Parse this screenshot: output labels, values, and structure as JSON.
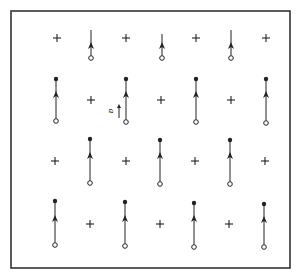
{
  "diagram": {
    "type": "lattice-vector-field",
    "frame": {
      "x": 11,
      "y": 11,
      "width": 279,
      "height": 257,
      "stroke": "#333333"
    },
    "colors": {
      "ink": "#222222",
      "background": "#ffffff"
    },
    "legend_label": {
      "text": "a",
      "x": 113,
      "y": 112
    },
    "legend_arrow": {
      "x": 119,
      "y1": 118,
      "y2": 104
    },
    "rows": [
      {
        "y_plus": 38,
        "items": [
          {
            "kind": "plus",
            "x": 57
          },
          {
            "kind": "arrow",
            "x": 91,
            "y_top": 30,
            "y_head": 47,
            "y_bottom": 58,
            "top_dot": false
          },
          {
            "kind": "plus",
            "x": 126
          },
          {
            "kind": "arrow",
            "x": 162,
            "y_top": 34,
            "y_head": 47,
            "y_bottom": 58,
            "top_dot": false
          },
          {
            "kind": "plus",
            "x": 196
          },
          {
            "kind": "arrow",
            "x": 231,
            "y_top": 30,
            "y_head": 47,
            "y_bottom": 58,
            "top_dot": false
          },
          {
            "kind": "plus",
            "x": 266
          }
        ]
      },
      {
        "y_plus": 100,
        "items": [
          {
            "kind": "arrow",
            "x": 56,
            "y_top": 79,
            "y_head": 96,
            "y_bottom": 121,
            "top_dot": true
          },
          {
            "kind": "plus",
            "x": 91
          },
          {
            "kind": "arrow",
            "x": 126,
            "y_top": 79,
            "y_head": 96,
            "y_bottom": 122,
            "top_dot": true
          },
          {
            "kind": "plus",
            "x": 161
          },
          {
            "kind": "arrow",
            "x": 196,
            "y_top": 79,
            "y_head": 96,
            "y_bottom": 122,
            "top_dot": true
          },
          {
            "kind": "plus",
            "x": 231
          },
          {
            "kind": "arrow",
            "x": 266,
            "y_top": 79,
            "y_head": 96,
            "y_bottom": 123,
            "top_dot": true
          }
        ]
      },
      {
        "y_plus": 161,
        "items": [
          {
            "kind": "plus",
            "x": 55
          },
          {
            "kind": "arrow",
            "x": 90,
            "y_top": 139,
            "y_head": 157,
            "y_bottom": 183,
            "top_dot": true
          },
          {
            "kind": "plus",
            "x": 126
          },
          {
            "kind": "arrow",
            "x": 160,
            "y_top": 140,
            "y_head": 157,
            "y_bottom": 184,
            "top_dot": true
          },
          {
            "kind": "plus",
            "x": 195
          },
          {
            "kind": "arrow",
            "x": 230,
            "y_top": 140,
            "y_head": 157,
            "y_bottom": 184,
            "top_dot": true
          },
          {
            "kind": "plus",
            "x": 265
          }
        ]
      },
      {
        "y_plus": 224,
        "items": [
          {
            "kind": "arrow",
            "x": 55,
            "y_top": 201,
            "y_head": 220,
            "y_bottom": 245,
            "top_dot": true
          },
          {
            "kind": "plus",
            "x": 90
          },
          {
            "kind": "arrow",
            "x": 125,
            "y_top": 202,
            "y_head": 220,
            "y_bottom": 246,
            "top_dot": true
          },
          {
            "kind": "plus",
            "x": 160
          },
          {
            "kind": "arrow",
            "x": 194,
            "y_top": 203,
            "y_head": 220,
            "y_bottom": 247,
            "top_dot": true
          },
          {
            "kind": "plus",
            "x": 229
          },
          {
            "kind": "arrow",
            "x": 264,
            "y_top": 204,
            "y_head": 221,
            "y_bottom": 247,
            "top_dot": true
          }
        ]
      }
    ]
  }
}
